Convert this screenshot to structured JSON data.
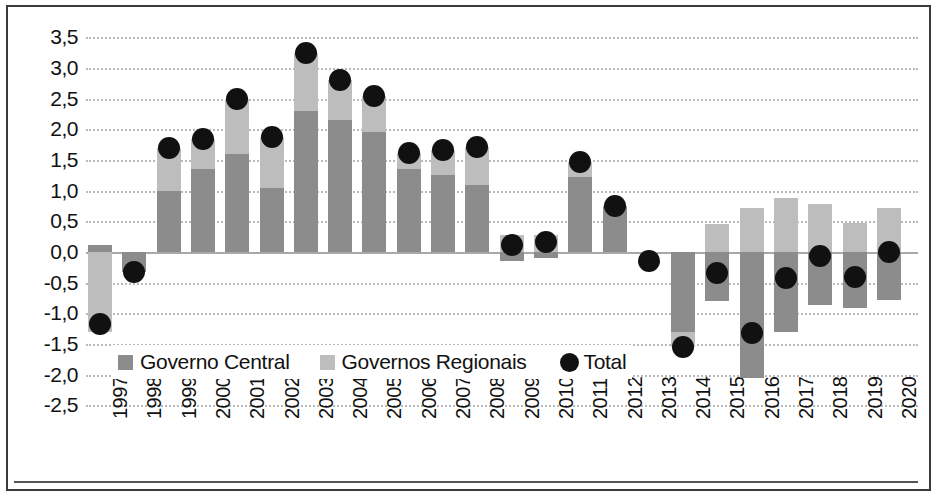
{
  "chart_data": {
    "type": "bar",
    "title": "",
    "xlabel": "",
    "ylabel": "",
    "ylim": [
      -2.5,
      3.5
    ],
    "ytick_step": 0.5,
    "grid": true,
    "decimal_separator": ",",
    "stacked": true,
    "legend_position": "inside-bottom-left",
    "categories": [
      "1997",
      "1998",
      "1999",
      "2000",
      "2001",
      "2002",
      "2003",
      "2004",
      "2005",
      "2006",
      "2007",
      "2008",
      "2009",
      "2010",
      "2011",
      "2012",
      "2013",
      "2014",
      "2015",
      "2016",
      "2017",
      "2018",
      "2019",
      "2020"
    ],
    "ytick_labels": [
      "3,5",
      "3,0",
      "2,5",
      "2,0",
      "1,5",
      "1,0",
      "0,5",
      "0,0",
      "-0,5",
      "-1,0",
      "-1,5",
      "-2,0",
      "-2,5"
    ],
    "ytick_values": [
      3.5,
      3.0,
      2.5,
      2.0,
      1.5,
      1.0,
      0.5,
      0.0,
      -0.5,
      -1.0,
      -1.5,
      -2.0,
      -2.5
    ],
    "series": [
      {
        "name": "Governo Central",
        "color": "#8c8c8c",
        "values": [
          0.12,
          -0.33,
          1.0,
          1.35,
          1.6,
          1.05,
          2.3,
          2.15,
          1.95,
          1.35,
          1.25,
          1.1,
          -0.15,
          -0.1,
          1.22,
          0.75,
          0.0,
          -1.3,
          -0.8,
          -2.05,
          -1.3,
          -0.87,
          -0.92,
          -0.78
        ]
      },
      {
        "name": "Governos Regionais",
        "color": "#bdbdbd",
        "values": [
          -1.3,
          0.0,
          0.7,
          0.5,
          0.9,
          0.83,
          0.95,
          0.65,
          0.6,
          0.27,
          0.42,
          0.62,
          0.27,
          0.27,
          0.25,
          0.0,
          0.0,
          -0.25,
          0.45,
          0.72,
          0.88,
          0.78,
          0.47,
          0.72
        ]
      }
    ],
    "total": {
      "name": "Total",
      "color": "#111111",
      "marker": "circle",
      "values": [
        -1.18,
        -0.33,
        1.7,
        1.85,
        2.5,
        1.88,
        3.25,
        2.8,
        2.55,
        1.62,
        1.67,
        1.72,
        0.12,
        0.17,
        1.47,
        0.75,
        -0.15,
        -1.55,
        -0.35,
        -1.32,
        -0.42,
        -0.07,
        -0.4,
        0.0
      ]
    }
  },
  "legend": {
    "items": [
      {
        "label": "Governo Central",
        "swatch": "#8c8c8c",
        "marker": "square"
      },
      {
        "label": "Governos Regionais",
        "swatch": "#bdbdbd",
        "marker": "square"
      },
      {
        "label": "Total",
        "swatch": "#111111",
        "marker": "circle"
      }
    ]
  }
}
